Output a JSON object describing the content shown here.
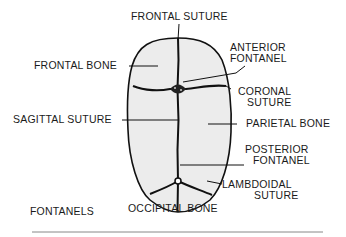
{
  "title": "FONTANELS",
  "colors": {
    "skull_fill": "#ececec",
    "outline": "#111111",
    "text": "#1a1a1a",
    "rule": "#888888"
  },
  "labels": {
    "frontal_suture": "FRONTAL SUTURE",
    "frontal_bone": "FRONTAL BONE",
    "anterior_fontanel_1": "ANTERIOR",
    "anterior_fontanel_2": "FONTANEL",
    "coronal_suture_1": "CORONAL",
    "coronal_suture_2": "SUTURE",
    "sagittal_suture": "SAGITTAL SUTURE",
    "parietal_bone": "PARIETAL BONE",
    "posterior_fontanel_1": "POSTERIOR",
    "posterior_fontanel_2": "FONTANEL",
    "lambdoidal_suture_1": "LAMBDOIDAL",
    "lambdoidal_suture_2": "SUTURE",
    "occipital_bone": "OCCIPITAL BONE"
  }
}
